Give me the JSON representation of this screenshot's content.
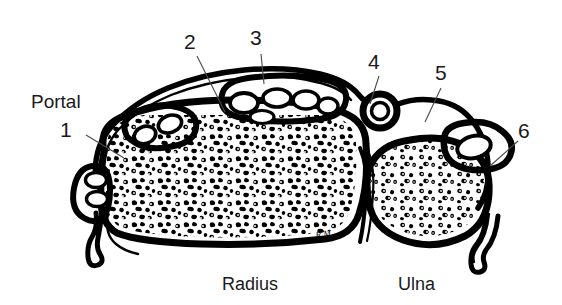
{
  "figure": {
    "kind": "anatomical-line-drawing",
    "view": "cross-section",
    "background_color": "#ffffff",
    "ink_color": "#000000",
    "leader_color": "#4a4a4a"
  },
  "labels": {
    "portal_word": "Portal",
    "numbers": [
      {
        "id": "1",
        "text": "1",
        "x": 66,
        "y": 130
      },
      {
        "id": "2",
        "text": "2",
        "x": 190,
        "y": 42
      },
      {
        "id": "3",
        "text": "3",
        "x": 256,
        "y": 38
      },
      {
        "id": "4",
        "text": "4",
        "x": 374,
        "y": 62
      },
      {
        "id": "5",
        "text": "5",
        "x": 441,
        "y": 73
      },
      {
        "id": "6",
        "text": "6",
        "x": 524,
        "y": 131
      }
    ],
    "bones": [
      {
        "id": "radius",
        "text": "Radius",
        "x": 250,
        "y": 283
      },
      {
        "id": "ulna",
        "text": "Ulna",
        "x": 418,
        "y": 283
      }
    ],
    "signature": "R.M."
  },
  "structures": {
    "radius": {
      "name": "Radius",
      "fill": "trabecular-bone"
    },
    "ulna": {
      "name": "Ulna",
      "fill": "trabecular-bone"
    },
    "vessels_top_left": 2,
    "vessels_top_center": 4,
    "vessel_top_right": 1,
    "vessel_right": 1,
    "vessels_left": 2
  }
}
